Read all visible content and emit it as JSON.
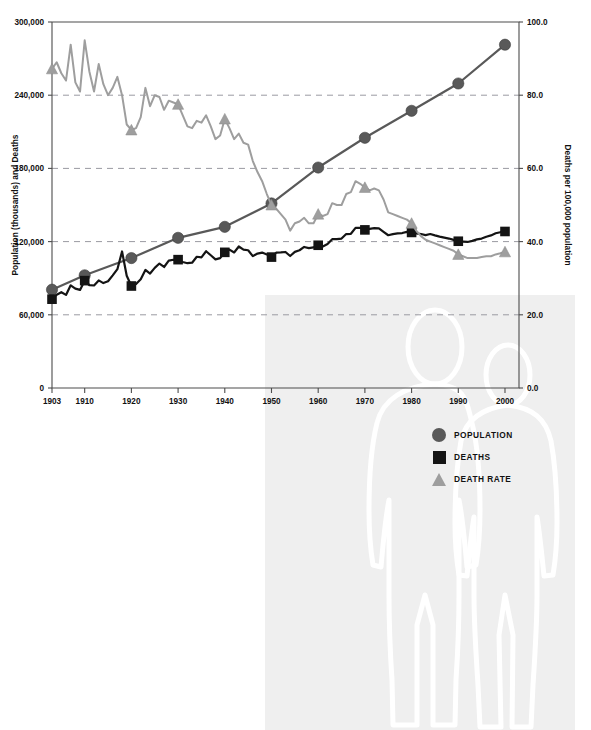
{
  "figure": {
    "background_color": "#ffffff",
    "panel_color": "#efefef",
    "illustration": "two-human-figures-outline"
  },
  "legend": {
    "position": "inside-lower-right",
    "items": [
      {
        "label": "POPULATION",
        "marker": "circle-icon",
        "color": "#595959"
      },
      {
        "label": "DEATHS",
        "marker": "square-icon",
        "color": "#141414"
      },
      {
        "label": "DEATH RATE",
        "marker": "triangle-icon",
        "color": "#9e9e9e"
      }
    ]
  },
  "chart_data": {
    "type": "line",
    "title": "",
    "xlabel": "",
    "ylabel": "Population (thousands) and Deaths",
    "y2label": "Deaths per 100,000 population",
    "xlim": [
      1903,
      2003
    ],
    "ylim": [
      0,
      300000
    ],
    "y2lim": [
      0.0,
      100.0
    ],
    "grid": true,
    "xticks": [
      1903,
      1910,
      1920,
      1930,
      1940,
      1950,
      1960,
      1970,
      1980,
      1990,
      2000
    ],
    "xticklabels": [
      "1903",
      "1910",
      "1920",
      "1930",
      "1940",
      "1950",
      "1960",
      "1970",
      "1980",
      "1990",
      "2000"
    ],
    "yticks": [
      0,
      60000,
      120000,
      180000,
      240000,
      300000
    ],
    "yticklabels": [
      "0",
      "60,000",
      "120,000",
      "180,000",
      "240,000",
      "300,000"
    ],
    "y2ticks": [
      0.0,
      20.0,
      40.0,
      60.0,
      80.0,
      100.0
    ],
    "y2ticklabels": [
      "0.0",
      "20.0",
      "40.0",
      "60.0",
      "80.0",
      "100.0"
    ],
    "series": [
      {
        "name": "POPULATION",
        "axis": "left",
        "marker": "circle",
        "color": "#595959",
        "marker_years": [
          1903,
          1910,
          1920,
          1930,
          1940,
          1950,
          1960,
          1970,
          1980,
          1990,
          2000
        ],
        "x": [
          1903,
          1910,
          1920,
          1930,
          1940,
          1950,
          1960,
          1970,
          1980,
          1990,
          2000
        ],
        "values": [
          80600,
          92400,
          106500,
          123100,
          132100,
          151300,
          180700,
          205100,
          227200,
          249600,
          281400
        ]
      },
      {
        "name": "DEATHS",
        "axis": "left",
        "marker": "square",
        "color": "#141414",
        "marker_years": [
          1903,
          1910,
          1920,
          1930,
          1940,
          1950,
          1960,
          1970,
          1980,
          1990,
          2000
        ],
        "x": [
          1903,
          1904,
          1905,
          1906,
          1907,
          1908,
          1909,
          1910,
          1911,
          1912,
          1913,
          1914,
          1915,
          1916,
          1917,
          1918,
          1919,
          1920,
          1921,
          1922,
          1923,
          1924,
          1925,
          1926,
          1927,
          1928,
          1929,
          1930,
          1931,
          1932,
          1933,
          1934,
          1935,
          1936,
          1937,
          1938,
          1939,
          1940,
          1941,
          1942,
          1943,
          1944,
          1945,
          1946,
          1947,
          1948,
          1949,
          1950,
          1951,
          1952,
          1953,
          1954,
          1955,
          1956,
          1957,
          1958,
          1959,
          1960,
          1961,
          1962,
          1963,
          1964,
          1965,
          1966,
          1967,
          1968,
          1969,
          1970,
          1971,
          1972,
          1973,
          1974,
          1975,
          1976,
          1977,
          1978,
          1979,
          1980,
          1981,
          1982,
          1983,
          1984,
          1985,
          1986,
          1987,
          1988,
          1989,
          1990,
          1991,
          1992,
          1993,
          1994,
          1995,
          1996,
          1997,
          1998,
          1999,
          2000
        ],
        "values": [
          72800,
          76400,
          78500,
          76300,
          84200,
          81500,
          80400,
          88000,
          84300,
          84000,
          88200,
          86000,
          87500,
          92300,
          97400,
          111900,
          92000,
          83600,
          85300,
          89200,
          96800,
          93800,
          98500,
          102000,
          99200,
          104400,
          105100,
          105200,
          103300,
          102300,
          102700,
          107600,
          107100,
          112100,
          108800,
          105400,
          106500,
          111200,
          113400,
          111100,
          116000,
          113400,
          112900,
          108100,
          110200,
          111000,
          109500,
          107300,
          110900,
          111100,
          111500,
          108200,
          111600,
          112900,
          115600,
          114700,
          115200,
          117000,
          116000,
          118000,
          122000,
          122000,
          122500,
          126200,
          126400,
          131300,
          131300,
          129600,
          130500,
          131000,
          130800,
          128000,
          125200,
          126100,
          126700,
          127000,
          128000,
          127500,
          126700,
          126200,
          125300,
          126200,
          125100,
          124100,
          123300,
          122500,
          121400,
          120300,
          120000,
          119700,
          120600,
          121800,
          122500,
          124000,
          125100,
          126800,
          127700,
          128300
        ]
      },
      {
        "name": "DEATH RATE",
        "axis": "right",
        "marker": "triangle",
        "color": "#9e9e9e",
        "marker_years": [
          1903,
          1920,
          1930,
          1940,
          1950,
          1960,
          1970,
          1980,
          1990,
          2000
        ],
        "x": [
          1903,
          1904,
          1905,
          1906,
          1907,
          1908,
          1909,
          1910,
          1911,
          1912,
          1913,
          1914,
          1915,
          1916,
          1917,
          1918,
          1919,
          1920,
          1921,
          1922,
          1923,
          1924,
          1925,
          1926,
          1927,
          1928,
          1929,
          1930,
          1931,
          1932,
          1933,
          1934,
          1935,
          1936,
          1937,
          1938,
          1939,
          1940,
          1941,
          1942,
          1943,
          1944,
          1945,
          1946,
          1947,
          1948,
          1949,
          1950,
          1951,
          1952,
          1953,
          1954,
          1955,
          1956,
          1957,
          1958,
          1959,
          1960,
          1961,
          1962,
          1963,
          1964,
          1965,
          1966,
          1967,
          1968,
          1969,
          1970,
          1971,
          1972,
          1973,
          1974,
          1975,
          1976,
          1977,
          1978,
          1979,
          1980,
          1981,
          1982,
          1983,
          1984,
          1985,
          1986,
          1987,
          1988,
          1989,
          1990,
          1991,
          1992,
          1993,
          1994,
          1995,
          1996,
          1997,
          1998,
          1999,
          2000
        ],
        "values": [
          87.2,
          89.0,
          86.0,
          84.0,
          93.8,
          83.5,
          81.0,
          95.0,
          86.5,
          81.0,
          88.5,
          83.0,
          80.0,
          82.0,
          85.0,
          80.0,
          72.0,
          70.5,
          71.0,
          74.0,
          82.0,
          77.0,
          80.0,
          79.5,
          76.0,
          78.5,
          78.0,
          77.5,
          74.5,
          71.5,
          71.0,
          73.0,
          72.5,
          74.5,
          71.5,
          68.0,
          69.0,
          73.5,
          71.0,
          68.0,
          69.5,
          67.0,
          66.5,
          62.0,
          59.0,
          56.5,
          53.0,
          50.0,
          49.0,
          47.5,
          46.0,
          43.0,
          45.0,
          45.5,
          46.5,
          45.0,
          45.0,
          47.5,
          47.0,
          47.5,
          50.5,
          50.0,
          50.0,
          53.0,
          53.5,
          56.5,
          55.8,
          54.8,
          54.0,
          54.5,
          54.0,
          51.5,
          48.0,
          47.5,
          47.0,
          46.5,
          46.0,
          45.0,
          43.0,
          41.5,
          40.5,
          40.0,
          39.5,
          39.0,
          38.5,
          38.0,
          37.5,
          36.5,
          36.0,
          35.5,
          35.5,
          35.5,
          35.8,
          36.0,
          36.0,
          36.5,
          36.8,
          37.2
        ]
      }
    ]
  }
}
